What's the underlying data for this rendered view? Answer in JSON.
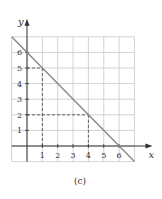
{
  "chart_data": {
    "type": "line",
    "title": "",
    "caption": "(c)",
    "xlabel": "x",
    "ylabel": "y",
    "xlim": [
      -1,
      7
    ],
    "ylim": [
      -1,
      7
    ],
    "grid": true,
    "x_ticks": [
      "1",
      "2",
      "3",
      "4",
      "5",
      "6"
    ],
    "y_ticks": [
      "1",
      "2",
      "3",
      "4",
      "5",
      "6"
    ],
    "series": [
      {
        "name": "line",
        "equation": "y = 6 - x",
        "x": [
          -1,
          7
        ],
        "y": [
          7,
          -1
        ],
        "color": "#888888"
      }
    ],
    "reference_points": [
      {
        "x": 1,
        "y": 5
      },
      {
        "x": 4,
        "y": 2
      }
    ]
  }
}
